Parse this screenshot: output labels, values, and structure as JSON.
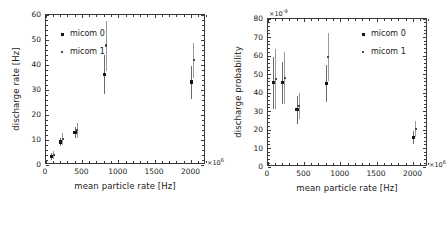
{
  "figure": {
    "panels": [
      {
        "id": "left",
        "ylabel": "discharge rate [Hz]",
        "xlabel": "mean particle rate [Hz]",
        "x_exponent_label": "×10",
        "x_exponent_sup": "6",
        "y_exponent_label": "",
        "y_exponent_sup": "",
        "legend": [
          {
            "label": "micom 0",
            "marker": "filled-square"
          },
          {
            "label": "micom 1",
            "marker": "small-square"
          }
        ],
        "yticks": [
          0,
          10,
          20,
          30,
          40,
          50,
          60
        ],
        "xticks": [
          0,
          500,
          1000,
          1500,
          2000
        ]
      },
      {
        "id": "right",
        "ylabel": "discharge probability",
        "xlabel": "mean particle rate [Hz]",
        "x_exponent_label": "×10",
        "x_exponent_sup": "6",
        "y_exponent_label": "×10",
        "y_exponent_sup": "-9",
        "legend": [
          {
            "label": "micom 0",
            "marker": "filled-square"
          },
          {
            "label": "micom 1",
            "marker": "small-square"
          }
        ],
        "yticks": [
          0,
          10,
          20,
          30,
          40,
          50,
          60,
          70,
          80
        ],
        "xticks": [
          0,
          500,
          1000,
          1500,
          2000
        ]
      }
    ]
  },
  "chart_data": [
    {
      "type": "scatter",
      "title": "",
      "xlabel": "mean particle rate [Hz]",
      "ylabel": "discharge rate [Hz]",
      "xlim": [
        0,
        2200
      ],
      "ylim": [
        0,
        60
      ],
      "x_scale_exponent": 6,
      "y_scale_exponent": 0,
      "grid": false,
      "legend_position": "upper-left",
      "series": [
        {
          "name": "micom 0",
          "x": [
            75,
            200,
            400,
            800,
            2000
          ],
          "y": [
            3.5,
            9.2,
            12.9,
            36.3,
            33.2
          ],
          "yerr_low": [
            1.3,
            1.6,
            2.2,
            7.8,
            6.6
          ],
          "yerr_high": [
            1.3,
            1.6,
            2.2,
            7.8,
            6.6
          ]
        },
        {
          "name": "micom 1",
          "x": [
            75,
            200,
            400,
            800,
            2000
          ],
          "y": [
            4.0,
            10.3,
            14.0,
            47.8,
            41.9
          ],
          "yerr_low": [
            1.5,
            2.4,
            3.0,
            10.0,
            7.0
          ],
          "yerr_high": [
            1.5,
            2.4,
            3.0,
            10.0,
            7.0
          ]
        }
      ]
    },
    {
      "type": "scatter",
      "title": "",
      "xlabel": "mean particle rate [Hz]",
      "ylabel": "discharge probability",
      "xlim": [
        0,
        2200
      ],
      "ylim": [
        0,
        80
      ],
      "x_scale_exponent": 6,
      "y_scale_exponent": -9,
      "grid": false,
      "legend_position": "upper-right",
      "series": [
        {
          "name": "micom 0",
          "x": [
            75,
            200,
            400,
            800,
            2000
          ],
          "y": [
            45.5,
            45.5,
            31.0,
            45.2,
            16.1
          ],
          "yerr_low": [
            14.0,
            11.5,
            7.5,
            10.0,
            3.5
          ],
          "yerr_high": [
            14.0,
            11.5,
            7.5,
            10.0,
            3.5
          ]
        },
        {
          "name": "micom 1",
          "x": [
            75,
            200,
            400,
            800,
            2000
          ],
          "y": [
            47.6,
            48.2,
            32.8,
            59.5,
            20.6
          ],
          "yerr_low": [
            16.0,
            14.0,
            7.0,
            13.0,
            4.5
          ],
          "yerr_high": [
            16.0,
            14.0,
            7.0,
            13.0,
            4.5
          ]
        }
      ]
    }
  ]
}
